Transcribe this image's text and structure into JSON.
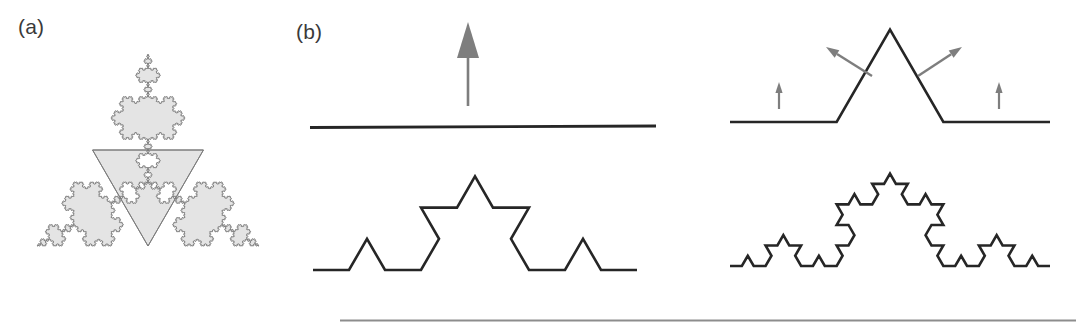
{
  "figure": {
    "background_color": "#ffffff",
    "ink_color": "#262626",
    "accent_gray": "#7e7e7e",
    "fill_gray": "#e4e4e4"
  },
  "panels": [
    {
      "id": "a",
      "label": "(a)",
      "name": "koch-snowflake-panel",
      "description": "Koch snowflake star with gray filled outer points and white interior triangle",
      "iterations": 5,
      "fill_color": "#e4e4e4",
      "outline_color": "#7d7d7d"
    },
    {
      "id": "b",
      "label": "(b)",
      "name": "koch-construction-panel",
      "description": "Koch curve construction sequence: initiator, generator with displacement arrows, and two further iterations",
      "stages": [
        {
          "name": "initiator-straight-line",
          "iteration": 0,
          "position": "top-left",
          "arrow_count": 1,
          "arrow_directions": [
            "up"
          ]
        },
        {
          "name": "generator-one-bump",
          "iteration": 1,
          "position": "top-right",
          "arrow_count": 4,
          "arrow_directions": [
            "up",
            "up-left",
            "up-right",
            "up"
          ]
        },
        {
          "name": "koch-curve-iteration-two",
          "iteration": 2,
          "position": "bottom-left",
          "arrow_count": 0,
          "arrow_directions": []
        },
        {
          "name": "koch-curve-iteration-three",
          "iteration": 3,
          "position": "bottom-right",
          "arrow_count": 0,
          "arrow_directions": []
        }
      ]
    }
  ],
  "chart_data": {
    "type": "line",
    "subtitle": "(a) Koch snowflake  (b) iterative generation of the Koch curve",
    "xlabel": "",
    "ylabel": "",
    "grid": false,
    "legend_position": "none",
    "annotations": [
      "(a)",
      "(b)"
    ],
    "series": [
      {
        "name": "initiator (n = 0)",
        "iteration": 0,
        "segment_count": 1
      },
      {
        "name": "generator (n = 1)",
        "iteration": 1,
        "segment_count": 4
      },
      {
        "name": "curve (n = 2)",
        "iteration": 2,
        "segment_count": 16
      },
      {
        "name": "curve (n = 3)",
        "iteration": 3,
        "segment_count": 64
      },
      {
        "name": "snowflake (n = 5)",
        "iteration": 5,
        "segment_count": 3072
      }
    ],
    "generator_rule": {
      "angles_deg": [
        0,
        60,
        -120,
        60
      ],
      "scale": 0.3333333333,
      "fractal_dimension": 1.2619
    }
  },
  "divider": {
    "name": "bottom-rule",
    "color": "#8d8d8d"
  }
}
